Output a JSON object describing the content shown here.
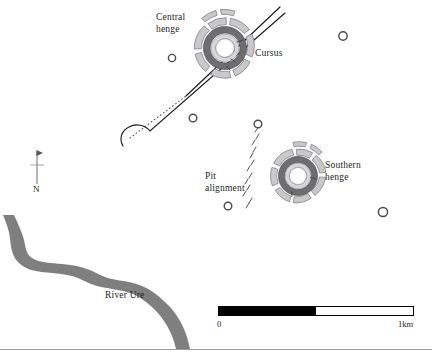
{
  "figure": {
    "name": "archaeological-site-plan",
    "background_color": "#ffffff",
    "width": 432,
    "height": 361
  },
  "labels": {
    "central_henge": "Central\nhenge",
    "cursus": "Cursus",
    "pit_alignment": "Pit\nalignment",
    "southern_henge": "Southern\nhenge",
    "river": "River Ure"
  },
  "north_arrow": {
    "letter": "N",
    "name": "north-arrow"
  },
  "scale_bar": {
    "start_label": "0",
    "end_label": "1km",
    "segments": 2,
    "filled_fraction": 0.5,
    "fill_color": "#000000",
    "empty_color": "#ffffff",
    "border_color": "#000000"
  },
  "colors": {
    "ink": "#231f20",
    "river": "#7f7f80",
    "henge_bank_dark": "#6e6e70",
    "henge_bank_light": "#c9c9cb",
    "henge_outline": "#4a4a4c",
    "line": "#1a1a1a",
    "rule": "#9b9b9b"
  },
  "features": {
    "henges": [
      {
        "name": "central-henge",
        "cx": 225,
        "cy": 48,
        "r": 31
      },
      {
        "name": "southern-henge",
        "cx": 298,
        "cy": 176,
        "r": 28
      }
    ],
    "round_barrows": [
      {
        "name": "round-barrow-1",
        "cx": 172,
        "cy": 58,
        "r": 4
      },
      {
        "name": "round-barrow-2",
        "cx": 343,
        "cy": 36,
        "r": 4.5
      },
      {
        "name": "round-barrow-3",
        "cx": 193,
        "cy": 118,
        "r": 4
      },
      {
        "name": "round-barrow-4",
        "cx": 258,
        "cy": 124,
        "r": 4
      },
      {
        "name": "round-barrow-5",
        "cx": 228,
        "cy": 206,
        "r": 4
      },
      {
        "name": "round-barrow-6",
        "cx": 383,
        "cy": 212,
        "r": 5
      }
    ],
    "cursus": {
      "name": "cursus",
      "description": "two parallel linear ditches running NE-SW with rounded SW terminal"
    },
    "pit_alignment": {
      "name": "pit-alignment",
      "description": "line of small elongated pit marks running NE-SW"
    },
    "river": {
      "name": "river-ure",
      "description": "meandering band crossing lower-left of plan"
    }
  }
}
